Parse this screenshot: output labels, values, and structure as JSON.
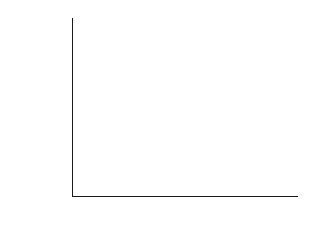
{
  "chart_data": {
    "type": "bar",
    "title": "",
    "xlabel": "",
    "ylabel": "ΔG_ad of O₂",
    "ylabel_main": "ΔG",
    "ylabel_sub": "ad",
    "ylabel_tail": " of O",
    "ylabel_tail_sub": "2",
    "categories": [
      "Undoped",
      "3.79A N-N",
      "O",
      "Hemo"
    ],
    "values": [
      -2.13,
      -1.7,
      -1.65,
      -2.26
    ],
    "ylim": [
      -2.26,
      -1.6
    ],
    "axis_top": -1.6,
    "axis_bottom": -2.26,
    "ytick_values": [
      -1.6,
      -1.7,
      -1.8,
      -1.9,
      -2.0,
      -2.1,
      -2.2
    ],
    "ytick_labels": [
      "-1.6",
      "-1.7",
      "-1.8",
      "-1.9",
      "-2.0",
      "-2.1",
      "-2.2"
    ],
    "grid": false,
    "legend": null,
    "bar_fill_color": "#c9c9c9",
    "bar_edge_color": "#4a4a4a",
    "axis_color": "#1a1a1a",
    "background_color": "#ffffff",
    "bar_style": "vertical-line-hatch",
    "note": "Bars span contiguously across category width, drawn downward from the top of the axis."
  }
}
